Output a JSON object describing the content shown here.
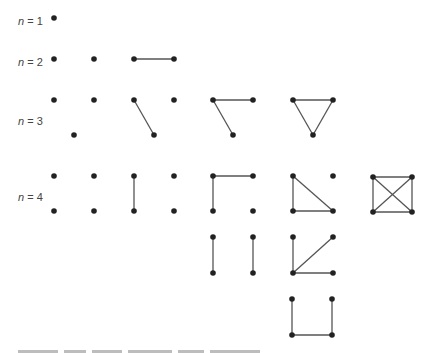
{
  "figure": {
    "vertex_color": "#222222",
    "edge_color": "#555555",
    "rows": [
      {
        "label_var": "n",
        "label_eq": " = 1",
        "y": 22
      },
      {
        "label_var": "n",
        "label_eq": " = 2",
        "y": 63
      },
      {
        "label_var": "n",
        "label_eq": " = 3",
        "y": 122
      },
      {
        "label_var": "n",
        "label_eq": " = 4",
        "y": 198
      }
    ],
    "graphs": [
      {
        "n": 1,
        "vertices": [
          [
            54,
            18
          ]
        ],
        "edges": []
      },
      {
        "n": 2,
        "vertices": [
          [
            54,
            59
          ],
          [
            94,
            59
          ]
        ],
        "edges": []
      },
      {
        "n": 2,
        "vertices": [
          [
            134,
            59
          ],
          [
            174,
            59
          ]
        ],
        "edges": [
          [
            0,
            1
          ]
        ]
      },
      {
        "n": 3,
        "vertices": [
          [
            54,
            100
          ],
          [
            94,
            100
          ],
          [
            74,
            135
          ]
        ],
        "edges": []
      },
      {
        "n": 3,
        "vertices": [
          [
            134,
            100
          ],
          [
            174,
            100
          ],
          [
            154,
            135
          ]
        ],
        "edges": [
          [
            0,
            2
          ]
        ]
      },
      {
        "n": 3,
        "vertices": [
          [
            213,
            100
          ],
          [
            253,
            100
          ],
          [
            233,
            135
          ]
        ],
        "edges": [
          [
            0,
            1
          ],
          [
            0,
            2
          ]
        ]
      },
      {
        "n": 3,
        "vertices": [
          [
            293,
            100
          ],
          [
            333,
            100
          ],
          [
            313,
            135
          ]
        ],
        "edges": [
          [
            0,
            1
          ],
          [
            0,
            2
          ],
          [
            1,
            2
          ]
        ]
      },
      {
        "n": 4,
        "vertices": [
          [
            54,
            176
          ],
          [
            94,
            176
          ],
          [
            54,
            211
          ],
          [
            94,
            211
          ]
        ],
        "edges": []
      },
      {
        "n": 4,
        "vertices": [
          [
            134,
            176
          ],
          [
            174,
            176
          ],
          [
            134,
            211
          ],
          [
            174,
            211
          ]
        ],
        "edges": [
          [
            0,
            2
          ]
        ]
      },
      {
        "n": 4,
        "vertices": [
          [
            213,
            176
          ],
          [
            253,
            176
          ],
          [
            213,
            211
          ],
          [
            253,
            211
          ]
        ],
        "edges": [
          [
            0,
            1
          ],
          [
            0,
            2
          ]
        ]
      },
      {
        "n": 4,
        "vertices": [
          [
            293,
            176
          ],
          [
            333,
            176
          ],
          [
            293,
            211
          ],
          [
            333,
            211
          ]
        ],
        "edges": [
          [
            0,
            2
          ],
          [
            0,
            3
          ],
          [
            2,
            3
          ]
        ]
      },
      {
        "n": 4,
        "vertices": [
          [
            373,
            177
          ],
          [
            412,
            177
          ],
          [
            373,
            212
          ],
          [
            412,
            212
          ]
        ],
        "edges": [
          [
            0,
            1
          ],
          [
            0,
            2
          ],
          [
            1,
            3
          ],
          [
            2,
            3
          ],
          [
            0,
            3
          ],
          [
            1,
            2
          ]
        ]
      },
      {
        "n": 4,
        "vertices": [
          [
            213,
            237
          ],
          [
            253,
            237
          ],
          [
            213,
            273
          ],
          [
            253,
            273
          ]
        ],
        "edges": [
          [
            0,
            2
          ],
          [
            1,
            3
          ]
        ]
      },
      {
        "n": 4,
        "vertices": [
          [
            293,
            237
          ],
          [
            333,
            237
          ],
          [
            293,
            273
          ],
          [
            333,
            273
          ]
        ],
        "edges": [
          [
            2,
            0
          ],
          [
            2,
            1
          ],
          [
            2,
            3
          ]
        ]
      },
      {
        "n": 4,
        "vertices": [
          [
            292,
            299
          ],
          [
            332,
            299
          ],
          [
            292,
            335
          ],
          [
            332,
            335
          ]
        ],
        "edges": [
          [
            0,
            2
          ],
          [
            2,
            3
          ],
          [
            3,
            1
          ]
        ]
      }
    ]
  },
  "caption": {
    "visible": "truncated"
  }
}
